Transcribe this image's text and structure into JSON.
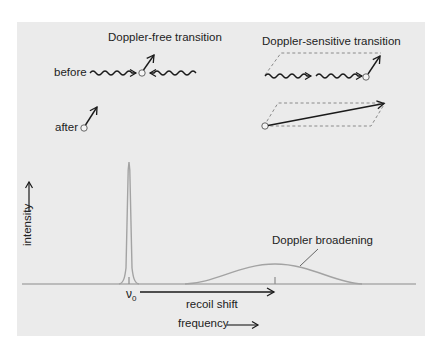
{
  "diagram": {
    "doppler_free": {
      "title": "Doppler-free transition",
      "before_label": "before",
      "after_label": "after"
    },
    "doppler_sensitive": {
      "title": "Doppler-sensitive transition"
    },
    "spectrum": {
      "y_axis_label": "intensity",
      "x_axis_label": "frequency",
      "nu0_label": "ν",
      "nu0_subscript": "0",
      "recoil_shift_label": "recoil shift",
      "broadening_label": "Doppler broadening"
    },
    "colors": {
      "panel_background": "#ebebeb",
      "curve_gray": "#a3a3a3",
      "ink": "#1a1a1a",
      "dashed": "#8a8a8a"
    }
  }
}
